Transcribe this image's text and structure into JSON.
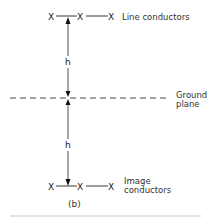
{
  "diagram": {
    "caption": "(b)",
    "line_conductors": {
      "label": "Line conductors",
      "markers": [
        "X",
        "X",
        "X"
      ]
    },
    "ground_plane": {
      "label_line1": "Ground",
      "label_line2": "plane"
    },
    "image_conductors": {
      "label_line1": "Image",
      "label_line2": "conductors",
      "markers": [
        "X",
        "X",
        "X"
      ]
    },
    "dimensions": {
      "upper_height": "h",
      "lower_height": "h"
    },
    "colors": {
      "ink": "#222222",
      "rule": "#c8c8c8",
      "background": "#ffffff"
    }
  }
}
